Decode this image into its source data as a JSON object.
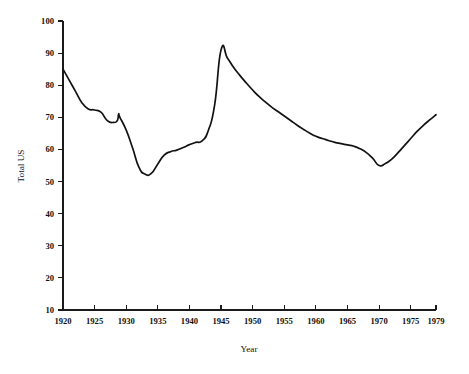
{
  "chart_data": {
    "type": "line",
    "title": "",
    "subtitle": "",
    "xlabel": "Year",
    "ylabel": "Total US",
    "xlim": [
      1920,
      1979
    ],
    "ylim": [
      10,
      100
    ],
    "grid": false,
    "legend": false,
    "legend_position": "none",
    "line_color": "#121212",
    "axis_color": "#1a1a1a",
    "background_color": "#ffffff",
    "xticks": [
      1920,
      1925,
      1930,
      1935,
      1940,
      1945,
      1950,
      1955,
      1960,
      1965,
      1970,
      1975,
      1979
    ],
    "xtick_labels": [
      "1920",
      "1925",
      "1930",
      "1935",
      "1940",
      "1945",
      "1950",
      "1955",
      "1960",
      "1965",
      "1970",
      "1975",
      "1979"
    ],
    "yticks": [
      10,
      20,
      30,
      40,
      50,
      60,
      70,
      80,
      90,
      100
    ],
    "ytick_labels": [
      "10",
      "20",
      "30",
      "40",
      "50",
      "60",
      "70",
      "80",
      "90",
      "100"
    ],
    "series": [
      {
        "name": "Total US",
        "x": [
          1920,
          1921,
          1922,
          1923,
          1924,
          1925,
          1926,
          1927,
          1928,
          1928.6,
          1928.8,
          1929,
          1930,
          1931,
          1932,
          1933,
          1934,
          1935,
          1936,
          1937,
          1938,
          1939,
          1940,
          1941,
          1942,
          1943,
          1944,
          1945,
          1946,
          1947,
          1948,
          1949,
          1950,
          1951,
          1952,
          1953,
          1954,
          1955,
          1956,
          1957,
          1958,
          1959,
          1960,
          1961,
          1962,
          1963,
          1964,
          1965,
          1966,
          1967,
          1968,
          1969,
          1970,
          1971,
          1972,
          1973,
          1974,
          1975,
          1976,
          1977,
          1978,
          1979
        ],
        "y": [
          85.0,
          81.5,
          78.0,
          74.5,
          72.6,
          72.3,
          71.6,
          69.0,
          68.4,
          69.0,
          71.0,
          70.0,
          66.0,
          60.5,
          54.5,
          52.3,
          52.6,
          55.5,
          58.2,
          59.3,
          59.8,
          60.6,
          61.5,
          62.2,
          62.7,
          66.0,
          74.0,
          91.0,
          88.5,
          85.5,
          83.0,
          80.7,
          78.5,
          76.5,
          74.8,
          73.2,
          71.8,
          70.4,
          69.0,
          67.6,
          66.3,
          65.1,
          64.1,
          63.4,
          62.8,
          62.2,
          61.8,
          61.4,
          61.0,
          60.2,
          59.0,
          57.2,
          55.0,
          55.6,
          57.0,
          59.0,
          61.2,
          63.4,
          65.6,
          67.5,
          69.2,
          70.8
        ]
      }
    ],
    "annotations": []
  },
  "axes": {
    "y_axis_title": "Total US",
    "x_axis_title": "Year"
  }
}
